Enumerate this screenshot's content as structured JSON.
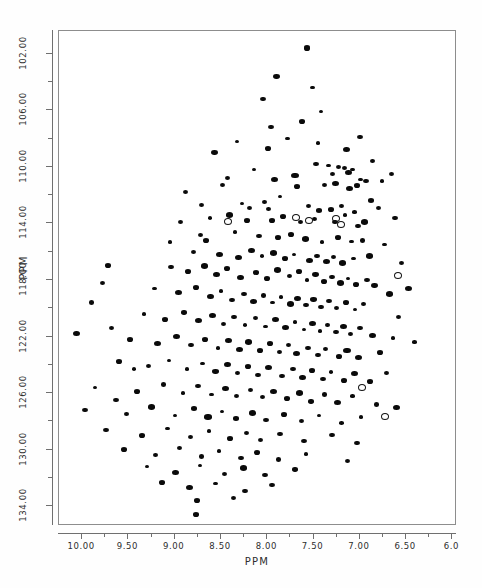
{
  "chart_data": {
    "type": "scatter",
    "title": "",
    "subtitle": "",
    "xlabel": "PPM",
    "ylabel": "PPM",
    "xlim": [
      10.25,
      5.95
    ],
    "ylim": [
      135.4,
      100.4
    ],
    "x_axis_inverted": true,
    "y_axis_inverted": true,
    "grid": false,
    "legend": null,
    "annotations": [],
    "xticks": [
      10.0,
      9.5,
      9.0,
      8.5,
      8.0,
      7.5,
      7.0,
      6.5,
      6.0
    ],
    "xtick_labels": [
      "10.00",
      "9.50",
      "9.00",
      "8.50",
      "8.00",
      "7.50",
      "7.00",
      "6.50",
      "6.0"
    ],
    "xminor_step": 0.25,
    "yticks": [
      102.0,
      106.0,
      110.0,
      114.0,
      118.0,
      122.0,
      126.0,
      130.0,
      134.0
    ],
    "ytick_labels": [
      "102.00",
      "106.00",
      "110.00",
      "114.00",
      "118.00",
      "122.00",
      "126.00",
      "130.00",
      "134.00"
    ],
    "yminor_step": 2.0,
    "marker_color": "#0a0a0a",
    "open_marker_color": "#141414",
    "series": [
      {
        "name": "cross-peaks (filled)",
        "style": "filled",
        "points": [
          [
            7.57,
            101.6
          ],
          [
            7.9,
            103.6
          ],
          [
            7.42,
            106.1
          ],
          [
            7.62,
            106.8
          ],
          [
            7.78,
            108.0
          ],
          [
            8.57,
            109.0
          ],
          [
            8.14,
            110.2
          ],
          [
            7.47,
            109.8
          ],
          [
            7.34,
            109.9
          ],
          [
            7.29,
            110.5
          ],
          [
            8.48,
            111.3
          ],
          [
            7.92,
            110.9
          ],
          [
            7.7,
            110.6
          ],
          [
            7.23,
            110.0
          ],
          [
            7.17,
            110.1
          ],
          [
            7.12,
            110.4
          ],
          [
            7.08,
            110.2
          ],
          [
            6.99,
            110.9
          ],
          [
            7.86,
            112.1
          ],
          [
            7.68,
            111.4
          ],
          [
            7.38,
            111.3
          ],
          [
            7.26,
            111.2
          ],
          [
            7.11,
            111.5
          ],
          [
            7.03,
            111.3
          ],
          [
            6.93,
            111.0
          ],
          [
            8.27,
            112.6
          ],
          [
            8.19,
            112.9
          ],
          [
            8.03,
            112.5
          ],
          [
            7.99,
            113.0
          ],
          [
            7.55,
            112.8
          ],
          [
            7.44,
            113.1
          ],
          [
            7.31,
            113.0
          ],
          [
            7.2,
            112.8
          ],
          [
            7.16,
            113.4
          ],
          [
            7.06,
            113.2
          ],
          [
            6.88,
            112.4
          ],
          [
            6.8,
            112.9
          ],
          [
            8.62,
            113.6
          ],
          [
            8.41,
            113.4
          ],
          [
            8.22,
            113.8
          ],
          [
            7.95,
            113.8
          ],
          [
            7.83,
            113.5
          ],
          [
            7.64,
            113.9
          ],
          [
            7.49,
            113.7
          ],
          [
            7.27,
            113.9
          ],
          [
            7.02,
            114.2
          ],
          [
            6.95,
            113.9
          ],
          [
            6.62,
            113.6
          ],
          [
            8.72,
            114.8
          ],
          [
            8.66,
            115.2
          ],
          [
            8.35,
            114.6
          ],
          [
            8.09,
            114.9
          ],
          [
            7.88,
            115.0
          ],
          [
            7.74,
            114.8
          ],
          [
            7.59,
            115.1
          ],
          [
            7.41,
            115.3
          ],
          [
            7.24,
            115.0
          ],
          [
            7.09,
            115.3
          ],
          [
            6.97,
            115.2
          ],
          [
            6.73,
            115.5
          ],
          [
            8.8,
            116.0
          ],
          [
            8.52,
            116.2
          ],
          [
            8.31,
            116.4
          ],
          [
            8.17,
            115.9
          ],
          [
            8.06,
            116.3
          ],
          [
            7.93,
            116.1
          ],
          [
            7.81,
            116.5
          ],
          [
            7.71,
            116.2
          ],
          [
            7.54,
            116.6
          ],
          [
            7.46,
            116.3
          ],
          [
            7.36,
            116.7
          ],
          [
            7.28,
            116.4
          ],
          [
            7.19,
            116.8
          ],
          [
            7.07,
            116.5
          ],
          [
            6.9,
            116.3
          ],
          [
            6.55,
            116.8
          ],
          [
            9.04,
            117.1
          ],
          [
            8.86,
            117.4
          ],
          [
            8.68,
            117.0
          ],
          [
            8.55,
            117.6
          ],
          [
            8.44,
            117.2
          ],
          [
            8.29,
            117.8
          ],
          [
            8.12,
            117.5
          ],
          [
            8.0,
            117.9
          ],
          [
            7.89,
            117.3
          ],
          [
            7.76,
            117.7
          ],
          [
            7.66,
            117.4
          ],
          [
            7.57,
            118.0
          ],
          [
            7.48,
            117.6
          ],
          [
            7.39,
            118.1
          ],
          [
            7.3,
            117.8
          ],
          [
            7.21,
            118.2
          ],
          [
            7.13,
            117.9
          ],
          [
            7.04,
            118.3
          ],
          [
            6.92,
            118.0
          ],
          [
            6.84,
            118.4
          ],
          [
            9.22,
            118.6
          ],
          [
            8.96,
            118.9
          ],
          [
            8.77,
            118.5
          ],
          [
            8.61,
            119.2
          ],
          [
            8.5,
            118.8
          ],
          [
            8.38,
            119.4
          ],
          [
            8.25,
            119.0
          ],
          [
            8.15,
            119.5
          ],
          [
            8.04,
            119.1
          ],
          [
            7.94,
            119.6
          ],
          [
            7.85,
            119.2
          ],
          [
            7.75,
            119.7
          ],
          [
            7.67,
            119.3
          ],
          [
            7.58,
            119.8
          ],
          [
            7.5,
            119.4
          ],
          [
            7.42,
            119.9
          ],
          [
            7.33,
            119.5
          ],
          [
            7.25,
            120.0
          ],
          [
            7.15,
            119.6
          ],
          [
            7.05,
            120.1
          ],
          [
            6.96,
            119.7
          ],
          [
            9.33,
            120.4
          ],
          [
            9.1,
            120.8
          ],
          [
            8.9,
            120.3
          ],
          [
            8.74,
            120.9
          ],
          [
            8.59,
            120.5
          ],
          [
            8.47,
            121.1
          ],
          [
            8.36,
            120.6
          ],
          [
            8.24,
            121.2
          ],
          [
            8.13,
            120.7
          ],
          [
            8.02,
            121.3
          ],
          [
            7.91,
            120.8
          ],
          [
            7.8,
            121.4
          ],
          [
            7.7,
            121.0
          ],
          [
            7.6,
            121.5
          ],
          [
            7.51,
            121.1
          ],
          [
            7.43,
            121.6
          ],
          [
            7.35,
            121.2
          ],
          [
            7.26,
            121.7
          ],
          [
            7.18,
            121.3
          ],
          [
            7.1,
            121.8
          ],
          [
            7.0,
            121.4
          ],
          [
            6.86,
            121.9
          ],
          [
            9.48,
            122.2
          ],
          [
            9.19,
            122.5
          ],
          [
            8.98,
            122.0
          ],
          [
            8.82,
            122.6
          ],
          [
            8.67,
            122.2
          ],
          [
            8.53,
            122.8
          ],
          [
            8.42,
            122.3
          ],
          [
            8.3,
            122.9
          ],
          [
            8.2,
            122.4
          ],
          [
            8.08,
            123.0
          ],
          [
            7.97,
            122.5
          ],
          [
            7.87,
            123.1
          ],
          [
            7.77,
            122.6
          ],
          [
            7.68,
            123.2
          ],
          [
            7.56,
            122.8
          ],
          [
            7.45,
            123.3
          ],
          [
            7.37,
            122.9
          ],
          [
            7.22,
            123.4
          ],
          [
            7.14,
            123.0
          ],
          [
            7.01,
            123.5
          ],
          [
            6.78,
            123.1
          ],
          [
            9.6,
            123.8
          ],
          [
            9.28,
            124.1
          ],
          [
            9.06,
            123.7
          ],
          [
            8.87,
            124.3
          ],
          [
            8.7,
            123.9
          ],
          [
            8.56,
            124.5
          ],
          [
            8.43,
            124.0
          ],
          [
            8.32,
            124.6
          ],
          [
            8.21,
            124.1
          ],
          [
            8.1,
            124.7
          ],
          [
            7.99,
            124.2
          ],
          [
            7.84,
            124.8
          ],
          [
            7.72,
            124.3
          ],
          [
            7.62,
            124.9
          ],
          [
            7.52,
            124.4
          ],
          [
            7.4,
            125.0
          ],
          [
            7.31,
            124.5
          ],
          [
            7.17,
            125.1
          ],
          [
            7.06,
            124.6
          ],
          [
            6.89,
            125.2
          ],
          [
            9.86,
            125.6
          ],
          [
            9.41,
            125.9
          ],
          [
            9.12,
            125.4
          ],
          [
            8.91,
            126.0
          ],
          [
            8.75,
            125.5
          ],
          [
            8.6,
            126.1
          ],
          [
            8.45,
            125.7
          ],
          [
            8.33,
            126.2
          ],
          [
            8.18,
            125.8
          ],
          [
            8.05,
            126.3
          ],
          [
            7.93,
            125.9
          ],
          [
            7.79,
            126.4
          ],
          [
            7.65,
            126.0
          ],
          [
            7.53,
            126.6
          ],
          [
            7.38,
            126.1
          ],
          [
            7.24,
            126.7
          ],
          [
            7.08,
            126.2
          ],
          [
            6.82,
            126.8
          ],
          [
            9.97,
            127.2
          ],
          [
            9.52,
            127.5
          ],
          [
            9.25,
            127.0
          ],
          [
            9.0,
            127.6
          ],
          [
            8.79,
            127.1
          ],
          [
            8.64,
            127.7
          ],
          [
            8.49,
            127.3
          ],
          [
            8.34,
            127.8
          ],
          [
            8.16,
            127.4
          ],
          [
            8.01,
            127.9
          ],
          [
            7.82,
            127.5
          ],
          [
            7.63,
            128.0
          ],
          [
            7.44,
            127.6
          ],
          [
            7.2,
            128.1
          ],
          [
            6.99,
            127.7
          ],
          [
            9.74,
            128.6
          ],
          [
            9.35,
            129.0
          ],
          [
            9.08,
            128.5
          ],
          [
            8.83,
            129.1
          ],
          [
            8.63,
            128.7
          ],
          [
            8.4,
            129.2
          ],
          [
            8.23,
            128.8
          ],
          [
            8.07,
            129.3
          ],
          [
            7.86,
            128.9
          ],
          [
            7.6,
            129.4
          ],
          [
            7.3,
            129.0
          ],
          [
            7.03,
            129.5
          ],
          [
            9.55,
            130.0
          ],
          [
            9.21,
            130.4
          ],
          [
            8.95,
            129.9
          ],
          [
            8.71,
            130.5
          ],
          [
            8.52,
            130.1
          ],
          [
            8.28,
            130.6
          ],
          [
            8.11,
            130.2
          ],
          [
            7.88,
            130.7
          ],
          [
            7.58,
            130.3
          ],
          [
            7.13,
            130.8
          ],
          [
            9.3,
            131.2
          ],
          [
            8.99,
            131.6
          ],
          [
            8.73,
            131.1
          ],
          [
            8.46,
            131.7
          ],
          [
            8.26,
            131.3
          ],
          [
            8.02,
            131.8
          ],
          [
            7.7,
            131.4
          ],
          [
            9.14,
            132.3
          ],
          [
            8.84,
            132.7
          ],
          [
            8.56,
            132.4
          ],
          [
            8.24,
            132.9
          ],
          [
            7.95,
            132.5
          ],
          [
            8.76,
            133.6
          ],
          [
            8.36,
            133.4
          ],
          [
            8.77,
            134.6
          ],
          [
            9.78,
            118.2
          ],
          [
            9.9,
            119.6
          ],
          [
            9.68,
            121.4
          ],
          [
            9.63,
            126.5
          ],
          [
            9.44,
            124.3
          ],
          [
            8.94,
            113.9
          ],
          [
            9.05,
            115.3
          ],
          [
            8.88,
            111.8
          ],
          [
            8.43,
            110.8
          ],
          [
            8.71,
            112.7
          ],
          [
            9.72,
            117.0
          ],
          [
            10.06,
            121.8
          ],
          [
            6.68,
            119.0
          ],
          [
            6.58,
            120.6
          ],
          [
            6.64,
            122.1
          ],
          [
            6.71,
            124.6
          ],
          [
            6.6,
            127.0
          ],
          [
            6.48,
            118.6
          ],
          [
            6.41,
            122.4
          ],
          [
            7.96,
            107.2
          ],
          [
            7.51,
            104.4
          ],
          [
            8.33,
            108.2
          ],
          [
            7.99,
            108.7
          ],
          [
            7.45,
            108.3
          ],
          [
            8.05,
            105.2
          ],
          [
            6.86,
            109.6
          ],
          [
            6.76,
            111.0
          ],
          [
            6.66,
            110.5
          ],
          [
            7.0,
            107.9
          ],
          [
            7.14,
            108.8
          ]
        ]
      },
      {
        "name": "cross-peaks (open / folded)",
        "style": "open",
        "points": [
          [
            8.44,
            113.8
          ],
          [
            7.56,
            113.7
          ],
          [
            7.27,
            113.6
          ],
          [
            7.22,
            114.0
          ],
          [
            6.6,
            117.6
          ],
          [
            6.99,
            125.5
          ],
          [
            6.74,
            127.6
          ],
          [
            7.7,
            113.5
          ]
        ]
      }
    ]
  }
}
